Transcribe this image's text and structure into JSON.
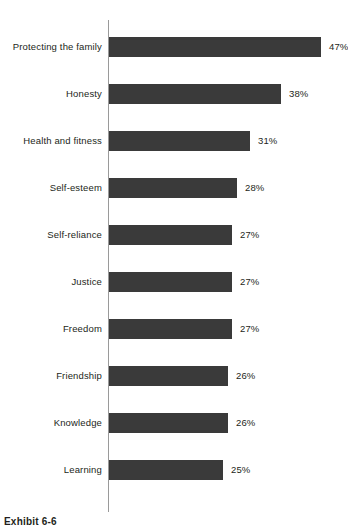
{
  "caption": "Exhibit 6-6",
  "colors": {
    "bar_fill": "#3a3a3a",
    "axis_line": "#9a9a9a",
    "text": "#231f20",
    "background": "#ffffff"
  },
  "chart_data": {
    "type": "bar",
    "orientation": "horizontal",
    "title": "",
    "subtitle": "",
    "xlabel": "",
    "ylabel": "",
    "grid": false,
    "legend": false,
    "xlim": [
      0,
      50
    ],
    "value_suffix": "%",
    "categories": [
      "Protecting the family",
      "Honesty",
      "Health and fitness",
      "Self-esteem",
      "Self-reliance",
      "Justice",
      "Freedom",
      "Friendship",
      "Knowledge",
      "Learning"
    ],
    "values": [
      47,
      38,
      31,
      28,
      27,
      27,
      27,
      26,
      26,
      25
    ],
    "value_labels": [
      "47%",
      "38%",
      "31%",
      "28%",
      "27%",
      "27%",
      "27%",
      "26%",
      "26%",
      "25%"
    ]
  }
}
